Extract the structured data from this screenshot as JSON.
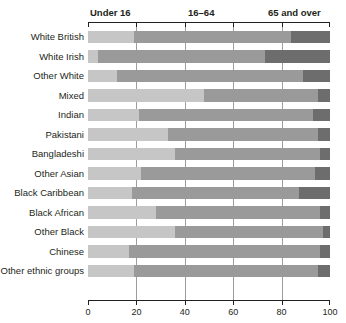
{
  "chart_data": {
    "type": "bar",
    "orientation": "horizontal",
    "stacked": true,
    "stacked_percent": true,
    "title": "",
    "xlabel": "",
    "ylabel": "",
    "xlim": [
      0,
      100
    ],
    "xticks": [
      0,
      20,
      40,
      60,
      80,
      100
    ],
    "xticklabels": [
      "0",
      "20",
      "40",
      "60",
      "80",
      "100"
    ],
    "grid": "vertical",
    "legend_position": "top-inline",
    "segment_headings": [
      {
        "label": "Under 16",
        "color": "#c6c6c6"
      },
      {
        "label": "16–64",
        "color": "#9a9a9a"
      },
      {
        "label": "65 and over",
        "color": "#6d6d6d"
      }
    ],
    "categories": [
      "White British",
      "White Irish",
      "Other White",
      "Mixed",
      "Indian",
      "Pakistani",
      "Bangladeshi",
      "Other Asian",
      "Black Caribbean",
      "Black African",
      "Other Black",
      "Chinese",
      "Other ethnic groups"
    ],
    "series": [
      {
        "name": "Under 16",
        "color": "#c6c6c6",
        "values": [
          19,
          4,
          12,
          48,
          21,
          33,
          36,
          22,
          18,
          28,
          36,
          17,
          19
        ]
      },
      {
        "name": "16–64",
        "color": "#9a9a9a",
        "values": [
          65,
          69,
          77,
          47,
          72,
          62,
          60,
          72,
          69,
          68,
          61,
          79,
          76
        ]
      },
      {
        "name": "65 and over",
        "color": "#6d6d6d",
        "values": [
          16,
          27,
          11,
          5,
          7,
          5,
          4,
          6,
          13,
          4,
          3,
          4,
          5
        ]
      }
    ],
    "cumulative_boundaries": [
      {
        "category": "White British",
        "under16_end": 19,
        "working_end": 84
      },
      {
        "category": "White Irish",
        "under16_end": 4,
        "working_end": 73
      },
      {
        "category": "Other White",
        "under16_end": 12,
        "working_end": 89
      },
      {
        "category": "Mixed",
        "under16_end": 48,
        "working_end": 95
      },
      {
        "category": "Indian",
        "under16_end": 21,
        "working_end": 93
      },
      {
        "category": "Pakistani",
        "under16_end": 33,
        "working_end": 95
      },
      {
        "category": "Bangladeshi",
        "under16_end": 36,
        "working_end": 96
      },
      {
        "category": "Other Asian",
        "under16_end": 22,
        "working_end": 94
      },
      {
        "category": "Black Caribbean",
        "under16_end": 18,
        "working_end": 87
      },
      {
        "category": "Black African",
        "under16_end": 28,
        "working_end": 96
      },
      {
        "category": "Other Black",
        "under16_end": 36,
        "working_end": 97
      },
      {
        "category": "Chinese",
        "under16_end": 17,
        "working_end": 96
      },
      {
        "category": "Other ethnic groups",
        "under16_end": 19,
        "working_end": 95
      }
    ]
  }
}
